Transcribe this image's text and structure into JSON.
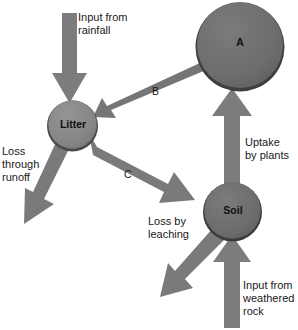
{
  "diagram": {
    "colors": {
      "node_fill": "#6e6e6e",
      "node_fill_light": "#8a8a8a",
      "node_edge_dark": "#3f3f3f",
      "arrow_fill": "#7a7a7a",
      "arrow_fill_dark": "#6b6b6b",
      "background": "#ffffff",
      "text": "#1a1a1a"
    },
    "nodes": [
      {
        "id": "A",
        "label": "A",
        "cx": 240,
        "cy": 46,
        "r": 45
      },
      {
        "id": "litter",
        "label": "Litter",
        "cx": 72.5,
        "cy": 125,
        "r": 25.5
      },
      {
        "id": "soil",
        "label": "Soil",
        "cx": 232.5,
        "cy": 211,
        "r": 29.5
      }
    ],
    "flows": [
      {
        "id": "rainfall",
        "label": "Input from\nrainfall",
        "from": "external",
        "to": "litter",
        "direction": "down"
      },
      {
        "id": "runoff",
        "label": "Loss\nthrough\nrunoff",
        "from": "litter",
        "to": "external",
        "direction": "down-left"
      },
      {
        "id": "uptake",
        "label": "Uptake\nby plants",
        "from": "soil",
        "to": "A",
        "direction": "up"
      },
      {
        "id": "leaching",
        "label": "Loss by\nleaching",
        "from": "soil",
        "to": "external",
        "direction": "down-left"
      },
      {
        "id": "weathered",
        "label": "Input from\nweathered\nrock",
        "from": "external",
        "to": "soil",
        "direction": "up"
      }
    ],
    "edges": [
      {
        "id": "B",
        "label": "B",
        "from": "A",
        "to": "litter"
      },
      {
        "id": "C",
        "label": "C",
        "from": "litter",
        "to": "soil"
      }
    ]
  }
}
